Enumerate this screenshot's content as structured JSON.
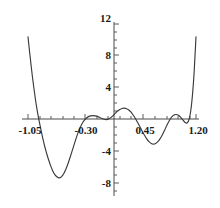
{
  "chart_data": {
    "type": "line",
    "title": "",
    "subtitle": "",
    "xlabel": "",
    "ylabel": "",
    "xlim": [
      -1.05,
      1.2
    ],
    "ylim": [
      -8,
      12
    ],
    "grid": false,
    "legend": null,
    "x_ticks": [
      {
        "value": -1.05,
        "label": "-1.05"
      },
      {
        "value": -0.3,
        "label": "-0.30"
      },
      {
        "value": 0.45,
        "label": "0.45"
      },
      {
        "value": 1.2,
        "label": "1.20"
      }
    ],
    "y_ticks": [
      {
        "value": 12,
        "label": "12"
      },
      {
        "value": 8,
        "label": "8"
      },
      {
        "value": 4,
        "label": "4"
      },
      {
        "value": -4,
        "label": "-4"
      },
      {
        "value": -8,
        "label": "-8"
      }
    ],
    "y_minor_tick_step": 1,
    "x_minor_tick_step": 0.15,
    "series": [
      {
        "name": "f(x)",
        "color": "#3a3a3a",
        "x": [
          -1.05,
          -1.03,
          -1.01,
          -0.99,
          -0.97,
          -0.95,
          -0.93,
          -0.91,
          -0.89,
          -0.87,
          -0.85,
          -0.83,
          -0.81,
          -0.79,
          -0.77,
          -0.75,
          -0.72,
          -0.69,
          -0.66,
          -0.63,
          -0.6,
          -0.57,
          -0.54,
          -0.51,
          -0.48,
          -0.45,
          -0.42,
          -0.39,
          -0.36,
          -0.33,
          -0.3,
          -0.27,
          -0.24,
          -0.21,
          -0.18,
          -0.15,
          -0.12,
          -0.09,
          -0.06,
          -0.03,
          0.0,
          0.03,
          0.06,
          0.09,
          0.12,
          0.15,
          0.18,
          0.21,
          0.24,
          0.27,
          0.3,
          0.33,
          0.36,
          0.39,
          0.42,
          0.45,
          0.48,
          0.51,
          0.54,
          0.57,
          0.6,
          0.63,
          0.66,
          0.69,
          0.72,
          0.75,
          0.78,
          0.81,
          0.84,
          0.87,
          0.9,
          0.93,
          0.96,
          0.99,
          1.02,
          1.05,
          1.08,
          1.11,
          1.14,
          1.17,
          1.2
        ],
        "y": [
          10.4,
          8.6,
          6.9,
          5.3,
          3.85,
          2.5,
          1.3,
          0.25,
          -0.7,
          -1.6,
          -2.45,
          -3.25,
          -3.95,
          -4.6,
          -5.2,
          -5.75,
          -6.45,
          -6.95,
          -7.25,
          -7.35,
          -7.2,
          -6.8,
          -6.2,
          -5.45,
          -4.6,
          -3.7,
          -2.8,
          -1.95,
          -1.2,
          -0.6,
          -0.15,
          0.15,
          0.35,
          0.45,
          0.48,
          0.45,
          0.38,
          0.25,
          0.12,
          0.02,
          -0.02,
          0.05,
          0.22,
          0.48,
          0.78,
          1.05,
          1.25,
          1.38,
          1.42,
          1.35,
          1.18,
          0.9,
          0.52,
          0.08,
          -0.42,
          -0.95,
          -1.5,
          -2.0,
          -2.45,
          -2.8,
          -3.02,
          -3.1,
          -3.02,
          -2.8,
          -2.42,
          -1.92,
          -1.35,
          -0.75,
          -0.2,
          0.25,
          0.52,
          0.62,
          0.55,
          0.32,
          -0.02,
          -0.35,
          -0.45,
          0.1,
          1.85,
          5.2,
          10.4
        ]
      }
    ]
  },
  "figure": {
    "background_color": "#ffffff",
    "axis_color": "#4a4a4a",
    "curve_color": "#3a3a3a",
    "text_color": "#1a1a1a"
  }
}
